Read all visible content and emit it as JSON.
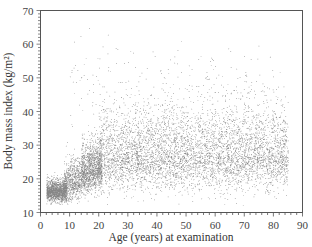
{
  "chart_data": {
    "type": "scatter",
    "title": "",
    "xlabel": "Age (years) at examination",
    "ylabel": "Body mass index (kg/m²)",
    "xlim": [
      0,
      90
    ],
    "ylim": [
      10,
      70
    ],
    "x_ticks": [
      0,
      10,
      20,
      30,
      40,
      50,
      60,
      70,
      80,
      90
    ],
    "y_ticks": [
      10,
      20,
      30,
      40,
      50,
      60,
      70
    ],
    "x_minor_step": 2,
    "y_minor_step": 1,
    "grid": false,
    "legend": null,
    "point_color": "#222222",
    "clusters": [
      {
        "name": "young-children",
        "x_range": [
          2,
          9
        ],
        "y_mean": 16.3,
        "y_sd": 1.4,
        "count": 1500,
        "skew": 0.6
      },
      {
        "name": "older-children",
        "x_range": [
          8,
          14
        ],
        "y_mean": 18.0,
        "y_sd": 2.6,
        "count": 700,
        "skew": 1.0
      },
      {
        "name": "adolescents",
        "x_range": [
          14,
          21
        ],
        "y_mean": 21.5,
        "y_sd": 3.0,
        "count": 1300,
        "skew": 1.2
      },
      {
        "name": "adults",
        "x_range": [
          20,
          85
        ],
        "y_mean": 27.0,
        "y_sd": 4.8,
        "count": 5200,
        "skew": 1.6
      },
      {
        "name": "outliers-high",
        "x_range": [
          10,
          80
        ],
        "y_mean": 48,
        "y_sd": 7,
        "count": 220,
        "skew": 0
      }
    ],
    "data_extent": {
      "x_max": 85,
      "y_min": 12,
      "y_max": 65
    }
  }
}
